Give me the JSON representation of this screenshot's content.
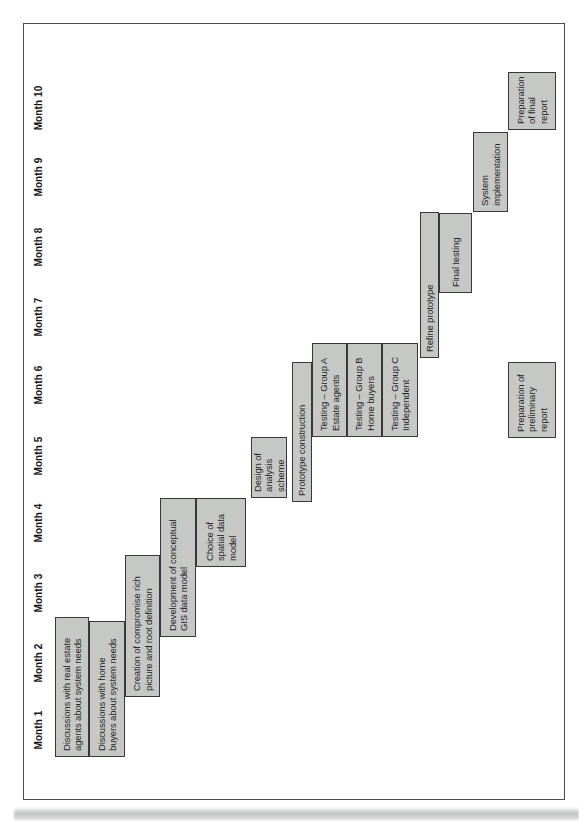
{
  "page": {
    "description": "Scanned book figure: project Gantt chart rotated 90 degrees on the page",
    "background": "#ffffff"
  },
  "chart_data": {
    "type": "bar",
    "variant": "gantt",
    "title": "",
    "xlabel": "",
    "ylabel": "",
    "axis_unit": "months",
    "axis_range": [
      0,
      10
    ],
    "grid": false,
    "legend": false,
    "orientation_note": "landscape Gantt chart printed rotated 90 degrees counter-clockwise; month labels read bottom-to-top",
    "months": [
      "Month 1",
      "Month 2",
      "Month 3",
      "Month 4",
      "Month 5",
      "Month 6",
      "Month 7",
      "Month 8",
      "Month 9",
      "Month 10"
    ],
    "axis": {
      "month_centers_px": [
        91,
        158,
        228,
        298,
        365,
        436,
        504,
        574,
        644,
        713
      ],
      "label_row_y_px": 31
    },
    "colors": {
      "bar_fill": "#c6c8c5",
      "bar_border": "#383838",
      "bar_text": "#262626",
      "frame_border": "#4e4e4e",
      "month_text": "#161616"
    },
    "tasks": [
      {
        "row": 1,
        "label": "Discussions with real estate\nagents about system needs",
        "start_month": 0.1,
        "end_month": 2.1,
        "px": {
          "x": 64,
          "y": 55,
          "w": 140,
          "h": 34
        }
      },
      {
        "row": 2,
        "label": "Discussions with home\nbuyers about system needs",
        "start_month": 0.1,
        "end_month": 2.1,
        "px": {
          "x": 64,
          "y": 89,
          "w": 136,
          "h": 36
        }
      },
      {
        "row": 3,
        "label": "Creation of compromise rich\npicture and root definition",
        "start_month": 1.0,
        "end_month": 3.0,
        "px": {
          "x": 124,
          "y": 125,
          "w": 142,
          "h": 35
        }
      },
      {
        "row": 4,
        "label": "Development of conceptual\nGIS data model",
        "start_month": 1.8,
        "end_month": 3.9,
        "px": {
          "x": 184,
          "y": 160,
          "w": 139,
          "h": 36
        }
      },
      {
        "row": 5,
        "label": "Choice of\nspatial data\nmodel",
        "start_month": 2.9,
        "end_month": 3.9,
        "px": {
          "x": 254,
          "y": 196,
          "w": 69,
          "h": 50
        }
      },
      {
        "row": 6,
        "label": "Design of\nanalysis\nscheme",
        "start_month": 3.9,
        "end_month": 4.7,
        "px": {
          "x": 323,
          "y": 251,
          "w": 61,
          "h": 36
        }
      },
      {
        "row": 7,
        "label": "Prototype construction",
        "start_month": 3.8,
        "end_month": 5.8,
        "px": {
          "x": 319,
          "y": 292,
          "w": 140,
          "h": 20
        }
      },
      {
        "row": 8,
        "label": "Testing – Group A\nEstate agents",
        "start_month": 4.7,
        "end_month": 6.1,
        "px": {
          "x": 384,
          "y": 312,
          "w": 94,
          "h": 35
        }
      },
      {
        "row": 9,
        "label": "Testing – Group B\nHome buyers",
        "start_month": 4.7,
        "end_month": 6.1,
        "px": {
          "x": 384,
          "y": 347,
          "w": 94,
          "h": 35
        }
      },
      {
        "row": 10,
        "label": "Testing – Group C\nIndependent",
        "start_month": 4.7,
        "end_month": 6.1,
        "px": {
          "x": 384,
          "y": 382,
          "w": 94,
          "h": 36
        }
      },
      {
        "row": 11,
        "label": "Refine prototype",
        "start_month": 5.9,
        "end_month": 8.0,
        "px": {
          "x": 463,
          "y": 420,
          "w": 146,
          "h": 19
        }
      },
      {
        "row": 12,
        "label": "Final testing",
        "start_month": 6.8,
        "end_month": 8.0,
        "px": {
          "x": 528,
          "y": 439,
          "w": 80,
          "h": 33
        }
      },
      {
        "row": 13,
        "label": "System\nimplementation",
        "start_month": 8.0,
        "end_month": 9.2,
        "px": {
          "x": 609,
          "y": 473,
          "w": 80,
          "h": 35
        }
      },
      {
        "row": 14,
        "label": "Preparation\nof final\nreport",
        "start_month": 9.2,
        "end_month": 10.0,
        "px": {
          "x": 691,
          "y": 508,
          "w": 58,
          "h": 48
        }
      },
      {
        "row": 14,
        "label": "Preparation of\npreliminary\nreport",
        "start_month": 4.7,
        "end_month": 5.8,
        "px": {
          "x": 383,
          "y": 508,
          "w": 76,
          "h": 48
        }
      }
    ]
  }
}
